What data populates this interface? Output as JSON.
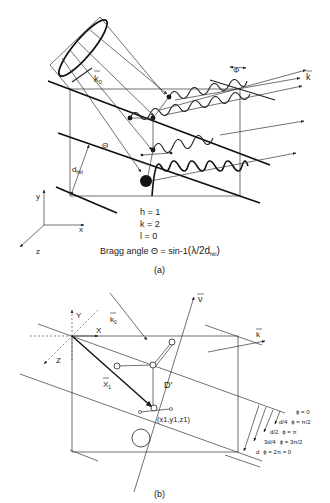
{
  "figure_a": {
    "caption": "(a)",
    "vector_k0": "k",
    "vector_k0_sub": "0",
    "vector_k": "k",
    "phase_label": "Φ",
    "angle_label": "Θ",
    "d_label": "d",
    "d_sub": "hkl",
    "axes": {
      "y": "y",
      "x": "x",
      "z": "z"
    },
    "miller": {
      "h": "h = 1",
      "k": "k = 2",
      "l": "l = 0"
    },
    "bragg": {
      "prefix": "Bragg angle Θ = sin-1",
      "formula": "(λ/2d",
      "sub": "hkl",
      "close": ")"
    }
  },
  "figure_b": {
    "caption": "(b)",
    "vector_k0": "k",
    "vector_k0_sub": "0",
    "vector_k": "k",
    "vector_nu": "ν",
    "axes": {
      "Y": "Y",
      "X": "X",
      "Z": "Z"
    },
    "x1_label": "X",
    "x1_sub": "1",
    "D_label": "D'",
    "coord_label": "(x1,y1,z1)",
    "phases": [
      {
        "depth": "",
        "phi": "ϕ = 0"
      },
      {
        "depth": "d/4",
        "phi": "ϕ = π/2"
      },
      {
        "depth": "d/2",
        "phi": "ϕ = π"
      },
      {
        "depth": "3d/4",
        "phi": "ϕ = 3π/2"
      },
      {
        "depth": "d",
        "phi": "ϕ = 2π = 0"
      }
    ]
  }
}
